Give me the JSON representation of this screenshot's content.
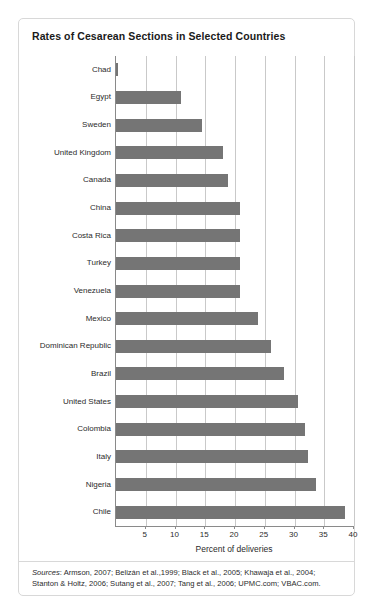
{
  "figure": {
    "title": "Rates of Cesarean Sections in Selected Countries",
    "sources_lead": "Sources",
    "sources_text": ": Armson, 2007; Belizán et al.,1999; Black et al., 2005; Khawaja et al., 2004; Stanton & Holtz, 2006; Sutang et al., 2007; Tang et al., 2006; UPMC.com; VBAC.com.",
    "bar_color": "#757575",
    "grid_color": "#c9c9c9",
    "axis_color": "#8a8a8a",
    "border_color": "#d8d8d8"
  },
  "chart_data": {
    "type": "bar",
    "orientation": "horizontal",
    "title": "Rates of Cesarean Sections in Selected Countries",
    "xlabel": "Percent of deliveries",
    "ylabel": "",
    "xlim": [
      0,
      40
    ],
    "xticks": [
      5,
      10,
      15,
      20,
      25,
      30,
      35,
      40
    ],
    "xtick_labels": [
      "5",
      "10",
      "15",
      "20",
      "25",
      "30",
      "35",
      "40"
    ],
    "grid": "vertical",
    "legend": "none",
    "categories": [
      "Chad",
      "Egypt",
      "Sweden",
      "United Kingdom",
      "Canada",
      "China",
      "Costa Rica",
      "Turkey",
      "Venezuela",
      "Mexico",
      "Dominican Republic",
      "Brazil",
      "United States",
      "Colombia",
      "Italy",
      "Nigeria",
      "Chile"
    ],
    "values": [
      0.4,
      11.0,
      14.5,
      18.0,
      18.8,
      20.8,
      20.9,
      20.9,
      20.9,
      23.8,
      26.0,
      28.2,
      30.6,
      31.8,
      32.2,
      33.6,
      38.5
    ]
  }
}
